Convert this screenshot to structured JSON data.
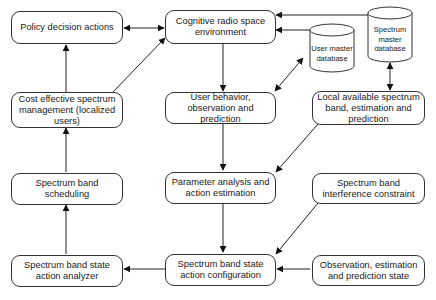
{
  "diagram": {
    "nodes": {
      "policy": "Policy decision actions",
      "cognitive": "Cognitive radio space environment",
      "cost": "Cost effective spectrum management (localized users)",
      "user_behavior": "User behavior, observation and prediction",
      "local_spectrum": "Local available spectrum band, estimation and prediction",
      "scheduling": "Spectrum band scheduling",
      "parameter": "Parameter analysis and action estimation",
      "interference": "Spectrum band interference constraint",
      "analyzer": "Spectrum band state action analyzer",
      "configuration": "Spectrum band state action configuration",
      "observation": "Observation, estimation and prediction state"
    },
    "databases": {
      "user_master": "User master database",
      "spectrum_master": "Spectrum master database"
    },
    "edges": [
      {
        "from": "policy",
        "to": "cognitive",
        "type": "bidirectional"
      },
      {
        "from": "cost",
        "to": "policy"
      },
      {
        "from": "cost",
        "to": "cognitive"
      },
      {
        "from": "spectrum_master",
        "to": "cognitive"
      },
      {
        "from": "user_master",
        "to": "cognitive"
      },
      {
        "from": "cognitive",
        "to": "user_behavior"
      },
      {
        "from": "user_master",
        "to": "user_behavior",
        "type": "bidirectional"
      },
      {
        "from": "spectrum_master",
        "to": "local_spectrum",
        "type": "bidirectional"
      },
      {
        "from": "user_behavior",
        "to": "parameter"
      },
      {
        "from": "local_spectrum",
        "to": "parameter"
      },
      {
        "from": "parameter",
        "to": "configuration"
      },
      {
        "from": "interference",
        "to": "configuration"
      },
      {
        "from": "observation",
        "to": "configuration"
      },
      {
        "from": "configuration",
        "to": "analyzer"
      },
      {
        "from": "analyzer",
        "to": "scheduling"
      },
      {
        "from": "scheduling",
        "to": "cost"
      }
    ]
  }
}
